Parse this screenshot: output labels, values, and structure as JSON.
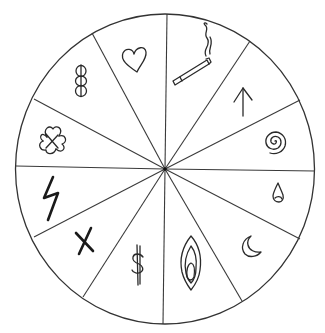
{
  "diagram": {
    "type": "wheel",
    "segment_count": 12,
    "colors": {
      "stroke": "#333333",
      "background": "#ffffff"
    },
    "segments": [
      {
        "index": 0,
        "position": "top-right",
        "symbol": "cigarette-icon",
        "description": "lit cigarette with smoke"
      },
      {
        "index": 1,
        "position": "upper-right",
        "symbol": "arrow-up-icon",
        "description": "upward arrow"
      },
      {
        "index": 2,
        "position": "right-upper",
        "symbol": "spiral-icon",
        "description": "spiral"
      },
      {
        "index": 3,
        "position": "right-lower",
        "symbol": "drop-icon",
        "description": "water drop"
      },
      {
        "index": 4,
        "position": "lower-right",
        "symbol": "moon-icon",
        "description": "crescent moon"
      },
      {
        "index": 5,
        "position": "bottom-right",
        "symbol": "flame-almond-icon",
        "description": "almond / flame shape"
      },
      {
        "index": 6,
        "position": "bottom-left",
        "symbol": "dollar-icon",
        "description": "dollar sign"
      },
      {
        "index": 7,
        "position": "lower-left",
        "symbol": "cross-x-icon",
        "description": "X cross"
      },
      {
        "index": 8,
        "position": "left-lower",
        "symbol": "lightning-icon",
        "description": "lightning bolt"
      },
      {
        "index": 9,
        "position": "left-upper",
        "symbol": "clover-icon",
        "description": "four-leaf clover"
      },
      {
        "index": 10,
        "position": "upper-left",
        "symbol": "stacked-circles-icon",
        "description": "three stacked circles"
      },
      {
        "index": 11,
        "position": "top-left",
        "symbol": "heart-icon",
        "description": "heart"
      }
    ]
  }
}
